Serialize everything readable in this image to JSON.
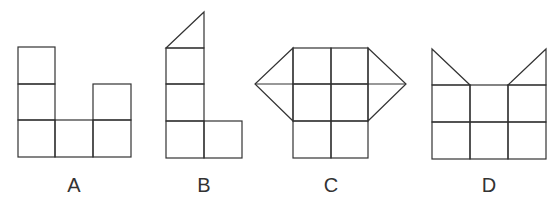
{
  "figures": [
    {
      "id": "A",
      "label": "A",
      "description": "net of 6 squares: 3-square column left, bottom row of 3, 2-square column right"
    },
    {
      "id": "B",
      "label": "B",
      "description": "3-square column with triangle on top, one square attached bottom-right"
    },
    {
      "id": "C",
      "label": "C",
      "description": "2x3 grid of squares with triangles on left and right of top two rows"
    },
    {
      "id": "D",
      "label": "D",
      "description": "3x2 grid of squares with right triangles on top-left and top-right"
    }
  ],
  "colors": {
    "stroke": "#333333",
    "background": "#ffffff"
  }
}
